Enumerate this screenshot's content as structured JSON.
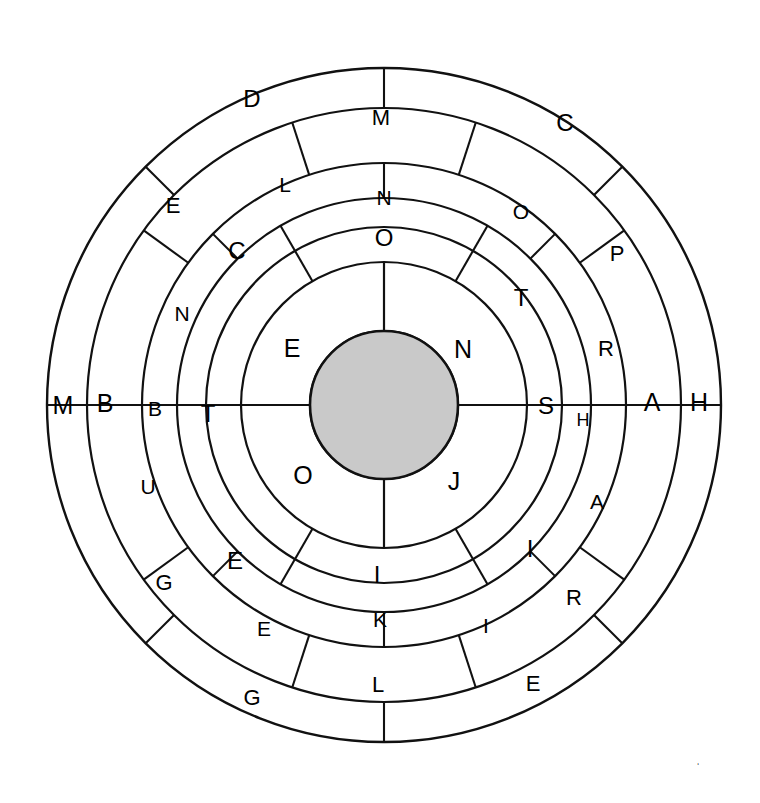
{
  "figure": {
    "background_color": "#ffffff",
    "stroke_color": "#111111",
    "core_fill_color": "#c9c9c9",
    "center": {
      "x": 384,
      "y": 405
    },
    "core": {
      "label": "",
      "radius": 74
    },
    "ring_radii": [
      74,
      143,
      178,
      207,
      242,
      297,
      337
    ],
    "corner_mark": "ˈ"
  },
  "rings": [
    {
      "name": "ring-1",
      "index": 1,
      "inner_radius": 74,
      "outer_radius": 143,
      "segment_count": 4,
      "start_angle": 0,
      "segments": [
        {
          "label": "N",
          "start": 0,
          "end": 90
        },
        {
          "label": "E",
          "start": 90,
          "end": 180
        },
        {
          "label": "O",
          "start": 180,
          "end": 270
        },
        {
          "label": "J",
          "start": 270,
          "end": 360
        }
      ]
    },
    {
      "name": "ring-2",
      "index": 2,
      "inner_radius": 143,
      "outer_radius": 207,
      "segment_count": 6,
      "start_angle": 0,
      "segments": [
        {
          "label": "T",
          "start": 0,
          "end": 60
        },
        {
          "label": "O",
          "start": 60,
          "end": 120
        },
        {
          "label": "C",
          "start": 120,
          "end": 180
        },
        {
          "label": "E",
          "start": 180,
          "end": 240
        },
        {
          "label": "I",
          "start": 240,
          "end": 300
        },
        {
          "label": "I",
          "start": 300,
          "end": 360
        }
      ]
    },
    {
      "name": "ring-3",
      "index": 3,
      "inner_radius": 207,
      "outer_radius": 242,
      "segment_count": 8,
      "start_angle": 0,
      "segments": [
        {
          "label": "H",
          "start": 0,
          "end": 45
        },
        {
          "label": "T",
          "start": 45,
          "end": 90
        },
        {
          "label": "N",
          "start": 90,
          "end": 135
        },
        {
          "label": "L",
          "start": 135,
          "end": 180
        },
        {
          "label": "U",
          "start": 180,
          "end": 225
        },
        {
          "label": "E",
          "start": 225,
          "end": 270
        },
        {
          "label": "K",
          "start": 270,
          "end": 315
        },
        {
          "label": "I",
          "start": 315,
          "end": 360
        }
      ]
    },
    {
      "name": "ring-4",
      "index": 4,
      "inner_radius": 242,
      "outer_radius": 297,
      "segment_count": 10,
      "start_angle": 0,
      "segments": [
        {
          "label": "A",
          "start": 0,
          "end": 36
        },
        {
          "label": "P",
          "start": 36,
          "end": 72
        },
        {
          "label": "O",
          "start": 72,
          "end": 108
        },
        {
          "label": "E",
          "start": 108,
          "end": 144
        },
        {
          "label": "B",
          "start": 144,
          "end": 180
        },
        {
          "label": "B",
          "start": 180,
          "end": 216
        },
        {
          "label": "G",
          "start": 216,
          "end": 252
        },
        {
          "label": "E",
          "start": 252,
          "end": 288
        },
        {
          "label": "I",
          "start": 288,
          "end": 324
        },
        {
          "label": "R",
          "start": 324,
          "end": 360
        }
      ]
    },
    {
      "name": "ring-5",
      "index": 5,
      "inner_radius": 297,
      "outer_radius": 337,
      "segment_count": 8,
      "start_angle": 0,
      "segments": [
        {
          "label": "H",
          "start": 0,
          "end": 45
        },
        {
          "label": "C",
          "start": 45,
          "end": 90
        },
        {
          "label": "D",
          "start": 90,
          "end": 135
        },
        {
          "label": "E",
          "start": 135,
          "end": 180
        },
        {
          "label": "M",
          "start": 180,
          "end": 225
        },
        {
          "label": "G",
          "start": 225,
          "end": 270
        },
        {
          "label": "L",
          "start": 270,
          "end": 315
        },
        {
          "label": "E",
          "start": 315,
          "end": 360
        }
      ]
    }
  ],
  "extra_labels": [
    {
      "name": "ring2-top-label",
      "text": "O",
      "x": 384,
      "y": 237
    },
    {
      "name": "ring3-top-label",
      "text": "N",
      "x": 384,
      "y": 197
    },
    {
      "name": "ring4-top-label",
      "text": "M",
      "x": 381,
      "y": 117
    },
    {
      "name": "ring2-left-label",
      "text": "T",
      "x": 208,
      "y": 413
    },
    {
      "name": "ring2-right-label",
      "text": "S",
      "x": 546,
      "y": 405
    },
    {
      "name": "ring3-left-label",
      "text": "B",
      "x": 155,
      "y": 408
    },
    {
      "name": "ring3-right-label",
      "text": "H",
      "x": 583,
      "y": 420
    },
    {
      "name": "ring4-left-label",
      "text": "B",
      "x": 105,
      "y": 403
    },
    {
      "name": "ring4-right-label",
      "text": "A",
      "x": 652,
      "y": 402
    },
    {
      "name": "ring5-left-label",
      "text": "M",
      "x": 63,
      "y": 405
    },
    {
      "name": "ring5-right-label",
      "text": "H",
      "x": 699,
      "y": 402
    },
    {
      "name": "ring1-nw-label",
      "text": "E",
      "x": 292,
      "y": 348
    },
    {
      "name": "ring1-ne-label",
      "text": "N",
      "x": 463,
      "y": 349
    },
    {
      "name": "ring1-sw-label",
      "text": "O",
      "x": 303,
      "y": 475
    },
    {
      "name": "ring1-se-label",
      "text": "J",
      "x": 454,
      "y": 481
    },
    {
      "name": "ring2-bottom-label",
      "text": "I",
      "x": 377,
      "y": 574
    },
    {
      "name": "ring3-bottom-label",
      "text": "K",
      "x": 380,
      "y": 619
    },
    {
      "name": "ring4-bottom-label",
      "text": "L",
      "x": 378,
      "y": 684
    },
    {
      "name": "ring2-ur-label",
      "text": "T",
      "x": 521,
      "y": 297
    },
    {
      "name": "ring2-ul-label",
      "text": "C",
      "x": 237,
      "y": 250
    },
    {
      "name": "ring2-ll-label",
      "text": "E",
      "x": 235,
      "y": 560
    },
    {
      "name": "ring2-lr-label",
      "text": "I",
      "x": 530,
      "y": 548
    },
    {
      "name": "ring3-ur-label",
      "text": "O",
      "x": 521,
      "y": 211
    },
    {
      "name": "ring3-ul-label",
      "text": "L",
      "x": 285,
      "y": 184
    },
    {
      "name": "ring3-ul2-label",
      "text": "N",
      "x": 182,
      "y": 313
    },
    {
      "name": "ring3-ll-label",
      "text": "U",
      "x": 148,
      "y": 486
    },
    {
      "name": "ring3-ll2-label",
      "text": "E",
      "x": 264,
      "y": 628
    },
    {
      "name": "ring3-lr-label",
      "text": "I",
      "x": 486,
      "y": 625
    },
    {
      "name": "ring3-lr2-label",
      "text": "A",
      "x": 597,
      "y": 501
    },
    {
      "name": "ring4-ur-label",
      "text": "P",
      "x": 617,
      "y": 253
    },
    {
      "name": "ring4-ur2-label",
      "text": "R",
      "x": 606,
      "y": 348
    },
    {
      "name": "ring4-ul-label",
      "text": "E",
      "x": 173,
      "y": 205
    },
    {
      "name": "ring4-ll-label",
      "text": "G",
      "x": 164,
      "y": 582
    },
    {
      "name": "ring4-lr-label",
      "text": "R",
      "x": 574,
      "y": 597
    },
    {
      "name": "ring4-br-label",
      "text": "E",
      "x": 533,
      "y": 683
    },
    {
      "name": "ring4-bl-label",
      "text": "G",
      "x": 252,
      "y": 697
    },
    {
      "name": "ring5-ul-label",
      "text": "D",
      "x": 252,
      "y": 98
    },
    {
      "name": "ring5-ur-label",
      "text": "C",
      "x": 565,
      "y": 122
    }
  ]
}
